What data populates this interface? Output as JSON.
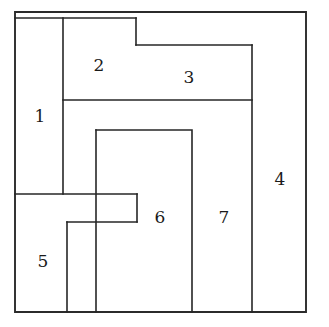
{
  "figure": {
    "background_color": "#ffffff",
    "line_color": "#262626",
    "label_color": "#1a1a1a",
    "canvas": {
      "width": 329,
      "height": 327
    },
    "outer_rect": {
      "x": 15,
      "y": 12,
      "width": 291,
      "height": 300
    }
  },
  "pieces": [
    {
      "id": "piece-1",
      "label": "1",
      "shape": "rectangle",
      "points": "15,18 63,18 63,194 15,194",
      "label_x": 40,
      "label_y": 117
    },
    {
      "id": "piece-2",
      "label": "2",
      "shape": "rectangle",
      "points": "63,18 136,18 136,100 63,100",
      "label_x": 99,
      "label_y": 66
    },
    {
      "id": "piece-3",
      "label": "3",
      "shape": "rectangle",
      "points": "136,45 252,45 252,100 136,100",
      "label_x": 189,
      "label_y": 78
    },
    {
      "id": "piece-4",
      "label": "4",
      "shape": "L-shape",
      "points": "136,12 306,12 306,312 252,312 252,45 136,45",
      "label_x": 280,
      "label_y": 180
    },
    {
      "id": "piece-5",
      "label": "5",
      "shape": "T-shape",
      "points": "15,194 137,194 137,222 67,222 67,312 15,312",
      "label_x": 43,
      "label_y": 262
    },
    {
      "id": "piece-6",
      "label": "6",
      "shape": "rectangle-with-notch",
      "points": "96,130 192,130 192,312 96,312",
      "label_x": 160,
      "label_y": 218
    },
    {
      "id": "piece-7",
      "label": "7",
      "shape": "rectangle",
      "points": "192,100 252,100 252,312 192,312",
      "label_x": 224,
      "label_y": 218
    }
  ],
  "edges": [
    {
      "name": "outer-boundary",
      "d": "M15,12 L306,12 L306,312 L15,312 Z"
    },
    {
      "name": "piece1-right-edge",
      "d": "M63,18 L63,194"
    },
    {
      "name": "piece1-top-edge",
      "d": "M15,18 L136,18"
    },
    {
      "name": "piece2-bottom-edge",
      "d": "M63,100 L252,100"
    },
    {
      "name": "piece3-left-edge",
      "d": "M136,18 L136,45"
    },
    {
      "name": "piece3-top-edge",
      "d": "M136,45 L252,45"
    },
    {
      "name": "piece4-left-edge",
      "d": "M252,45 L252,312"
    },
    {
      "name": "piece6-outline",
      "d": "M96,130 L192,130 L192,312"
    },
    {
      "name": "piece6-left-edge",
      "d": "M96,130 L96,312"
    },
    {
      "name": "piece5-top-edge",
      "d": "M15,194 L137,194"
    },
    {
      "name": "piece5-arm-right-edge",
      "d": "M137,194 L137,222"
    },
    {
      "name": "piece5-arm-bottom-edge",
      "d": "M137,222 L67,222"
    },
    {
      "name": "piece5-stem-right-edge",
      "d": "M67,222 L67,312"
    }
  ]
}
